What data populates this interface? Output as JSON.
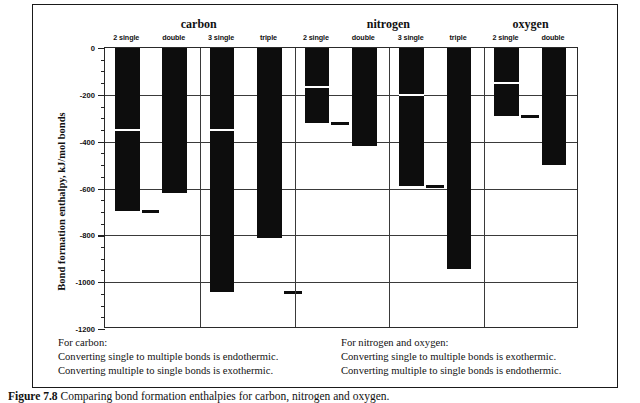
{
  "chart_data": {
    "type": "bar",
    "title": "",
    "xlabel": "",
    "ylabel": "Bond formation enthalpy, kJ/mol bonds",
    "ylim": [
      -1200,
      0
    ],
    "ytick_step": 200,
    "yminor_step": 50,
    "grid": true,
    "legend": "none",
    "yticks": [
      "0",
      "-200",
      "-400",
      "-600",
      "-800",
      "-1000",
      "-1200"
    ],
    "groups": [
      {
        "name": "carbon",
        "series": [
          {
            "label": "2 single",
            "value": -696,
            "split_at": -348,
            "marker": -696
          },
          {
            "label": "double",
            "value": -620,
            "split_at": null,
            "marker": null
          },
          {
            "label": "3 single",
            "value": -1044,
            "split_at": -348,
            "marker": null
          },
          {
            "label": "triple",
            "value": -812,
            "split_at": null,
            "marker": -1044
          }
        ]
      },
      {
        "name": "nitrogen",
        "series": [
          {
            "label": "2 single",
            "value": -322,
            "split_at": -161,
            "marker": -322
          },
          {
            "label": "double",
            "value": -418,
            "split_at": null,
            "marker": null
          },
          {
            "label": "3 single",
            "value": -588,
            "split_at": -196,
            "marker": -588
          },
          {
            "label": "triple",
            "value": -945,
            "split_at": null,
            "marker": null
          }
        ]
      },
      {
        "name": "oxygen",
        "series": [
          {
            "label": "2 single",
            "value": -290,
            "split_at": -145,
            "marker": -290
          },
          {
            "label": "double",
            "value": -498,
            "split_at": null,
            "marker": null
          }
        ]
      }
    ]
  },
  "notes": {
    "left": {
      "heading": "For carbon:",
      "line1": "Converting single to multiple bonds is endothermic.",
      "line2": "Converting multiple to single bonds is exothermic."
    },
    "right": {
      "heading": "For nitrogen and oxygen:",
      "line1": "Converting single to multiple bonds is exothermic.",
      "line2": "Converting multiple to single bonds is endothermic."
    }
  },
  "caption": {
    "label": "Figure 7.8",
    "text": "Comparing bond formation enthalpies for carbon, nitrogen and oxygen."
  }
}
